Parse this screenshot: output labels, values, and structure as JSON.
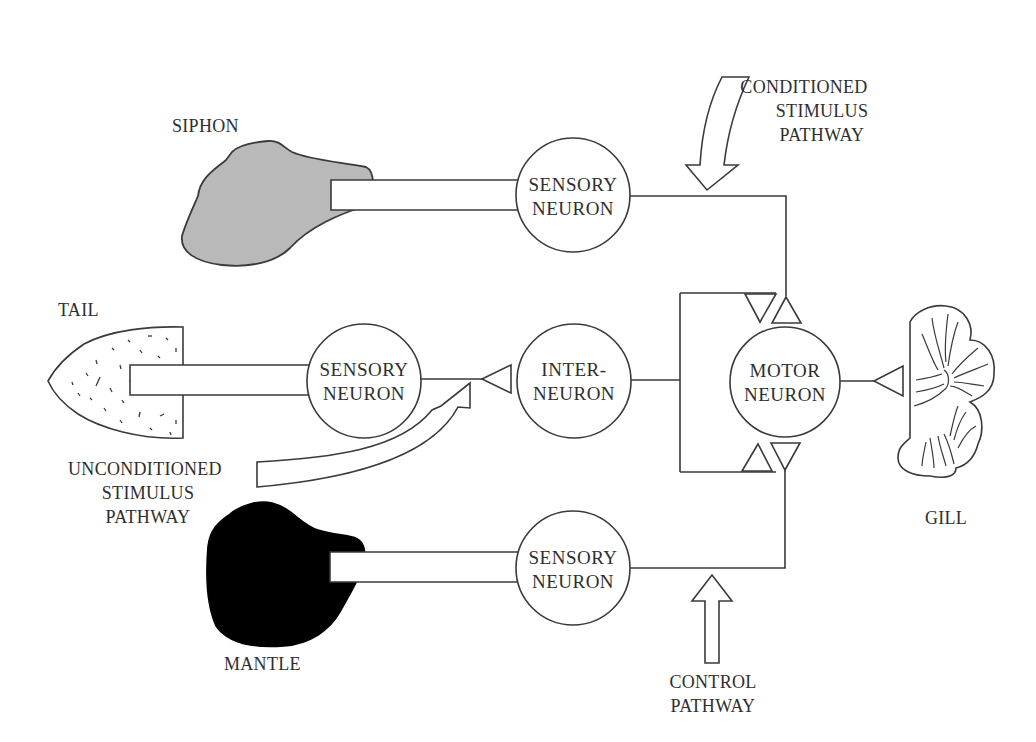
{
  "diagram": {
    "colors": {
      "line": "#3a3a3a",
      "siphon_fill": "#b9b9b9",
      "mantle_fill": "#000000",
      "background": "#ffffff"
    },
    "organs": {
      "siphon": "SIPHON",
      "tail": "TAIL",
      "mantle": "MANTLE",
      "gill": "GILL"
    },
    "neurons": {
      "siphon_sensory": {
        "line1": "SENSORY",
        "line2": "NEURON"
      },
      "tail_sensory": {
        "line1": "SENSORY",
        "line2": "NEURON"
      },
      "mantle_sensory": {
        "line1": "SENSORY",
        "line2": "NEURON"
      },
      "interneuron": {
        "line1": "INTER-",
        "line2": "NEURON"
      },
      "motor": {
        "line1": "MOTOR",
        "line2": "NEURON"
      }
    },
    "pathways": {
      "conditioned": {
        "line1": "CONDITIONED",
        "line2": "STIMULUS",
        "line3": "PATHWAY"
      },
      "unconditioned": {
        "line1": "UNCONDITIONED",
        "line2": "STIMULUS",
        "line3": "PATHWAY"
      },
      "control": {
        "line1": "CONTROL",
        "line2": "PATHWAY"
      }
    }
  }
}
